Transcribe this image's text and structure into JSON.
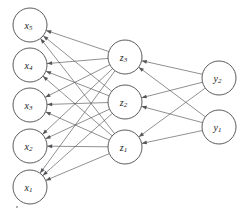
{
  "diagram": {
    "type": "neural-network-graph",
    "background_color": "#ffffff",
    "node_stroke_color": "#4a4a4a",
    "node_fill_color": "#ffffff",
    "edge_color": "#55555a",
    "label_color": "#1a1a1a",
    "node_radius": 17,
    "arrow_direction": "right-to-left",
    "layers": [
      {
        "id": "input",
        "name": "input-layer",
        "nodes": [
          {
            "id": "x5",
            "base": "x",
            "sub": "5",
            "cx": 30,
            "cy": 25
          },
          {
            "id": "x4",
            "base": "x",
            "sub": "4",
            "cx": 30,
            "cy": 65
          },
          {
            "id": "x3",
            "base": "x",
            "sub": "3",
            "cx": 30,
            "cy": 105
          },
          {
            "id": "x2",
            "base": "x",
            "sub": "2",
            "cx": 30,
            "cy": 146
          },
          {
            "id": "x1",
            "base": "x",
            "sub": "1",
            "cx": 30,
            "cy": 187
          }
        ]
      },
      {
        "id": "hidden",
        "name": "hidden-layer",
        "nodes": [
          {
            "id": "z3",
            "base": "z",
            "sub": "3",
            "cx": 125,
            "cy": 57
          },
          {
            "id": "z2",
            "base": "z",
            "sub": "2",
            "cx": 125,
            "cy": 102
          },
          {
            "id": "z1",
            "base": "z",
            "sub": "1",
            "cx": 125,
            "cy": 147
          }
        ]
      },
      {
        "id": "output",
        "name": "output-layer",
        "nodes": [
          {
            "id": "y2",
            "base": "y",
            "sub": "2",
            "cx": 219,
            "cy": 78
          },
          {
            "id": "y1",
            "base": "y",
            "sub": "1",
            "cx": 219,
            "cy": 127
          }
        ]
      }
    ],
    "edges": [
      {
        "from": "z3",
        "to": "x5"
      },
      {
        "from": "z2",
        "to": "x5"
      },
      {
        "from": "z1",
        "to": "x5"
      },
      {
        "from": "z3",
        "to": "x4"
      },
      {
        "from": "z2",
        "to": "x4"
      },
      {
        "from": "z1",
        "to": "x4"
      },
      {
        "from": "z3",
        "to": "x3"
      },
      {
        "from": "z2",
        "to": "x3"
      },
      {
        "from": "z1",
        "to": "x3"
      },
      {
        "from": "z3",
        "to": "x2"
      },
      {
        "from": "z2",
        "to": "x2"
      },
      {
        "from": "z1",
        "to": "x2"
      },
      {
        "from": "z3",
        "to": "x1"
      },
      {
        "from": "z2",
        "to": "x1"
      },
      {
        "from": "z1",
        "to": "x1"
      },
      {
        "from": "y2",
        "to": "z3"
      },
      {
        "from": "y1",
        "to": "z3"
      },
      {
        "from": "y2",
        "to": "z2"
      },
      {
        "from": "y1",
        "to": "z2"
      },
      {
        "from": "y2",
        "to": "z1"
      },
      {
        "from": "y1",
        "to": "z1"
      }
    ],
    "specks": [
      {
        "cx": 17,
        "cy": 207,
        "r": 0.9
      }
    ]
  }
}
